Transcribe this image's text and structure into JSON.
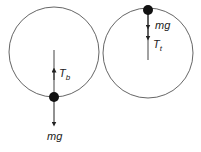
{
  "diagrams": [
    {
      "name": "bottom-position",
      "circle": {
        "cx": 54,
        "cy": 52,
        "r": 45
      },
      "ball": {
        "cx": 54,
        "cy": 97
      },
      "forces": [
        {
          "symbol": "T",
          "subscript": "b",
          "direction": "up"
        },
        {
          "symbol": "mg",
          "subscript": "",
          "direction": "down"
        }
      ]
    },
    {
      "name": "top-position",
      "circle": {
        "cx": 148,
        "cy": 53,
        "r": 45
      },
      "ball": {
        "cx": 148,
        "cy": 10
      },
      "forces": [
        {
          "symbol": "mg",
          "subscript": "",
          "direction": "down"
        },
        {
          "symbol": "T",
          "subscript": "t",
          "direction": "down"
        }
      ]
    }
  ],
  "colors": {
    "stroke": "#555555",
    "ball": "#111111",
    "text": "#222222"
  }
}
